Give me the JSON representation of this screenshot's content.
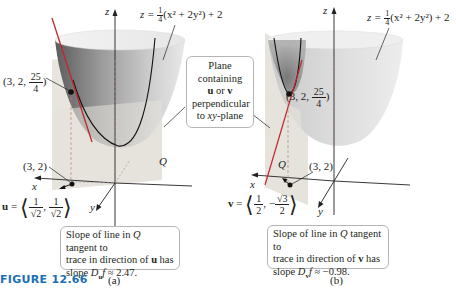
{
  "figure": {
    "label": "FIGURE 12.66",
    "label_color": "#1a6fb5"
  },
  "panel_a": {
    "caption": "(a)",
    "axis_z": "z",
    "axis_x": "x",
    "axis_y": "y",
    "surface_eq": {
      "lhs": "z = ",
      "frac_num": "1",
      "frac_den": "4",
      "rhs": "(x² + 2y²) + 2"
    },
    "point_3d": {
      "prefix": "(3, 2, ",
      "frac_num": "25",
      "frac_den": "4",
      "suffix": ")"
    },
    "point_2d": "(3, 2)",
    "plane_label": "Q",
    "vector": {
      "name": "u",
      "eq": " = ",
      "c1_num": "1",
      "c1_den": "√2",
      "sep": ",",
      "c2_sign": "",
      "c2_num": "1",
      "c2_den": "√2"
    },
    "slope_box": {
      "line1_a": "Slope of line in ",
      "line1_q": "Q",
      "line1_b": " tangent to",
      "line2_a": "trace in direction of ",
      "line2_v": "u",
      "line2_b": " has",
      "line3_a": "slope ",
      "line3_d": "D",
      "line3_sub": "u",
      "line3_f": "f",
      "line3_b": " ≈ 2.47."
    }
  },
  "panel_b": {
    "caption": "(b)",
    "axis_z": "z",
    "axis_x": "x",
    "axis_y": "y",
    "surface_eq": {
      "lhs": "z = ",
      "frac_num": "1",
      "frac_den": "4",
      "rhs": "(x² + 2y²) + 2"
    },
    "point_3d": {
      "prefix": "(3, 2, ",
      "frac_num": "25",
      "frac_den": "4",
      "suffix": ")"
    },
    "point_2d": "(3, 2)",
    "plane_label": "Q",
    "vector": {
      "name": "v",
      "eq": " = ",
      "c1_num": "1",
      "c1_den": "2",
      "sep": ",",
      "c2_sign": "−",
      "c2_num": "√3",
      "c2_den": "2"
    },
    "slope_box": {
      "line1_a": "Slope of line in ",
      "line1_q": "Q",
      "line1_b": " tangent to",
      "line2_a": "trace in direction of ",
      "line2_v": "v",
      "line2_b": " has",
      "line3_a": "slope ",
      "line3_d": "D",
      "line3_sub": "v",
      "line3_f": "f",
      "line3_b": " ≈ −0.98."
    }
  },
  "plane_callout": {
    "line1": "Plane",
    "line2": "containing",
    "line3_u": "u",
    "line3_or": " or ",
    "line3_v": "v",
    "line4": "perpendicular",
    "line5_a": "to ",
    "line5_xy": "xy",
    "line5_b": "-plane"
  },
  "colors": {
    "tangent_line": "#c0272d",
    "surface_dark": "#7a7a7a",
    "surface_light": "#e6e6e6",
    "plane": "#e4e2da",
    "callout_border": "#b5b5b5"
  }
}
